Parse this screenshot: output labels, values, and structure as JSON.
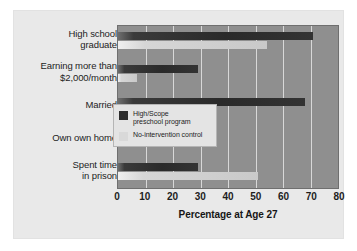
{
  "chart_data": {
    "type": "bar",
    "orientation": "horizontal",
    "title": "",
    "xlabel": "Percentage at Age 27",
    "ylabel": "",
    "xlim": [
      0,
      80
    ],
    "xticks": [
      0,
      10,
      20,
      30,
      40,
      50,
      60,
      70,
      80
    ],
    "grid": true,
    "legend_position": "inside-right",
    "categories": [
      "High school graduate",
      "Earning more than $2,000/month",
      "Married",
      "Own own home",
      "Spent time in prison"
    ],
    "category_lines": [
      [
        "High school",
        "graduate"
      ],
      [
        "Earning more than",
        "$2,000/month"
      ],
      [
        "Married"
      ],
      [
        "Own own home"
      ],
      [
        "Spent time",
        "in prison"
      ]
    ],
    "series": [
      {
        "name": "High/Scope preschool program",
        "color": "#2c2c2c",
        "values": [
          71,
          29,
          68,
          36,
          29
        ]
      },
      {
        "name": "No-intervention control",
        "color": "#d9d9d9",
        "values": [
          54,
          7,
          2,
          13,
          51
        ]
      }
    ]
  },
  "legend": {
    "entries": [
      {
        "lines": [
          "High/Scope",
          "preschool program"
        ]
      },
      {
        "lines": [
          "No-intervention control"
        ]
      }
    ]
  },
  "axis": {
    "title": "Percentage at Age 27",
    "ticks": [
      "0",
      "10",
      "20",
      "30",
      "40",
      "50",
      "60",
      "70",
      "80"
    ]
  },
  "colors": {
    "page_background": "#ffffff",
    "card_background": "#e9e9e9",
    "plot_background": "#8f8f8f",
    "gridline": "#d8d8d8",
    "series_dark": "#2c2c2c",
    "series_light": "#d9d9d9",
    "text": "#1d1d1d"
  }
}
